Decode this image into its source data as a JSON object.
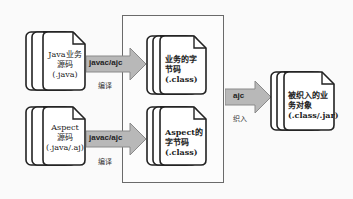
{
  "diagram": {
    "title": "",
    "sources": [
      {
        "id": "java-source",
        "lines": [
          "Java业务",
          "源码",
          "(.java)"
        ]
      },
      {
        "id": "aspect-source",
        "lines": [
          "Aspect",
          "源码",
          "(.java/.aj)"
        ]
      }
    ],
    "compile_arrows": [
      {
        "label": "javac/ajc",
        "sublabel": "编译"
      },
      {
        "label": "javac/ajc",
        "sublabel": "编译"
      }
    ],
    "bytecode": [
      {
        "id": "business-bytecode",
        "lines": [
          "业务的字",
          "节码",
          "(.class)"
        ]
      },
      {
        "id": "aspect-bytecode",
        "lines": [
          "Aspect的",
          "字节码",
          "(.class)"
        ]
      }
    ],
    "weave_arrow": {
      "label": "ajc",
      "sublabel": "织入"
    },
    "result": {
      "id": "woven-object",
      "lines": [
        "被织入的业",
        "务对象",
        "(.class/.jar)"
      ]
    },
    "colors": {
      "arrow_fill": "#b8b8b8",
      "arrow_stroke": "#8a8a8a",
      "doc_stroke": "#222222",
      "doc_fill": "#ffffff",
      "box_stroke": "#6a6a6a"
    }
  }
}
